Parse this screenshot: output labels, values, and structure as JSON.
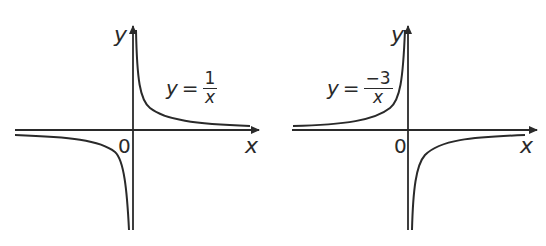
{
  "graphs": [
    {
      "id": "left",
      "equation": {
        "lhs": "y",
        "op": "=",
        "numerator": "1",
        "denominator": "x"
      },
      "axis_labels": {
        "x": "x",
        "y": "y",
        "origin": "0"
      }
    },
    {
      "id": "right",
      "equation": {
        "lhs": "y",
        "op": "=",
        "numerator": "−3",
        "denominator": "x"
      },
      "axis_labels": {
        "x": "x",
        "y": "y",
        "origin": "0"
      }
    }
  ],
  "colors": {
    "stroke": "#2a2a2a",
    "background": "#ffffff"
  }
}
